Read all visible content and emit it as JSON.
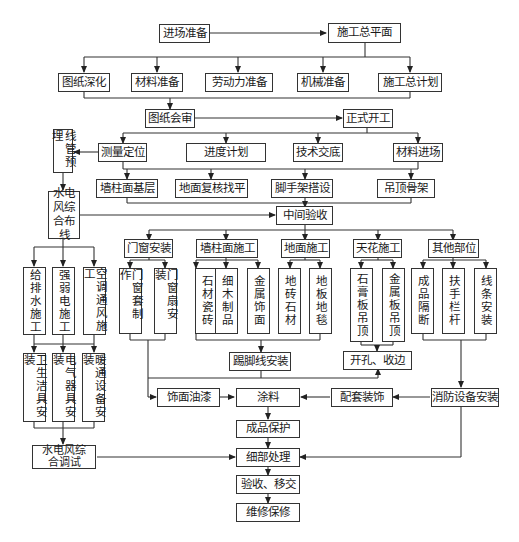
{
  "diagram": {
    "type": "construction-process-flowchart",
    "nodes": {
      "jinchang": "进场准备",
      "zongpingmian": "施工总平面",
      "tuzhi_shenhua": "图纸深化",
      "cailiao_zhunbei": "材料准备",
      "laodongli": "劳动力准备",
      "jixie": "机械准备",
      "zongjihua": "施工总计划",
      "tuzhi_huishen": "图纸会审",
      "zhengshi_kaigong": "正式开工",
      "xianguan": "线管预埋",
      "celiang": "测量定位",
      "jindu": "进度计划",
      "jishu": "技术交底",
      "cailiao_jinchang": "材料进场",
      "qiangzhu_jiceng": "墙柱面基层",
      "dimian_fuhe": "地面复核找平",
      "jiaoshoujia": "脚手架搭设",
      "diaoding_gujia": "吊顶骨架",
      "shuidianfeng_buxian": "水电风综合布线",
      "zhongjian_yanshou": "中间验收",
      "menchuang": "门窗安装",
      "qiangzhu_shigong": "墙柱面施工",
      "dimian_shigong": "地面施工",
      "tianhua": "天花施工",
      "qita": "其他部位",
      "geipaishui": "给排水施工",
      "qiangruodian": "强弱电施工",
      "kongtiao": "空调通风施工",
      "menchuangtao": "门窗套制作",
      "menchuangshan": "门窗扇安装",
      "shicai_ciz": "石材瓷砖",
      "ximu": "细木制品",
      "jinshu_shimian": "金属饰面",
      "dizhuan": "地砖石材",
      "diban": "地板地毯",
      "shigao": "石膏板吊顶",
      "jinshuban": "金属板吊顶",
      "chengpin_geduan": "成品隔断",
      "fushou": "扶手栏杆",
      "xiantiao": "线条安装",
      "weisheng": "卫生洁具安装",
      "dianqi": "电气器具安装",
      "nuantong": "暖通设备安装",
      "tijiaoxian": "踢脚线安装",
      "kaikong": "开孔、收边",
      "shimian_youqi": "饰面油漆",
      "tuliao": "涂料",
      "peitao": "配套装饰",
      "xiaofang": "消防设备安装",
      "shuidianfeng_tiaoshi": "水电风综合调试",
      "chengpin_baohu": "成品保护",
      "xibu": "细部处理",
      "yanshou_yijiao": "验收、移交",
      "weixiu": "维修保修"
    }
  }
}
